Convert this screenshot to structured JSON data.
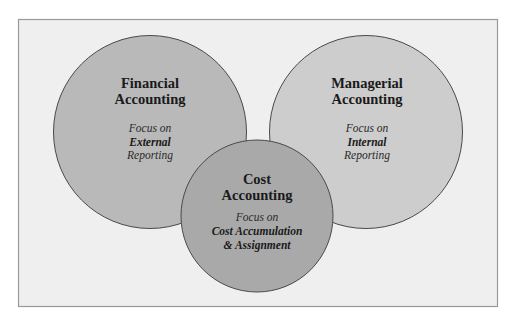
{
  "diagram": {
    "type": "venn",
    "colors": {
      "page_background": "#ffffff",
      "panel_background": "#efefef",
      "panel_border": "#9a9a9a",
      "circle_stroke": "#4a4a4a",
      "financial_fill": "#b9b9b9",
      "managerial_fill": "#cdcdcd",
      "cost_fill": "#a9a9a9"
    },
    "circles": [
      {
        "id": "financial",
        "title_line1": "Financial",
        "title_line2": "Accounting",
        "focus_label": "Focus on",
        "focus_emphasis": "External",
        "focus_tail": "Reporting"
      },
      {
        "id": "managerial",
        "title_line1": "Managerial",
        "title_line2": "Accounting",
        "focus_label": "Focus on",
        "focus_emphasis": "Internal",
        "focus_tail": "Reporting"
      },
      {
        "id": "cost",
        "title_line1": "Cost",
        "title_line2": "Accounting",
        "focus_label": "Focus on",
        "focus_emphasis": "Cost Accumulation",
        "focus_tail": "& Assignment"
      }
    ]
  }
}
